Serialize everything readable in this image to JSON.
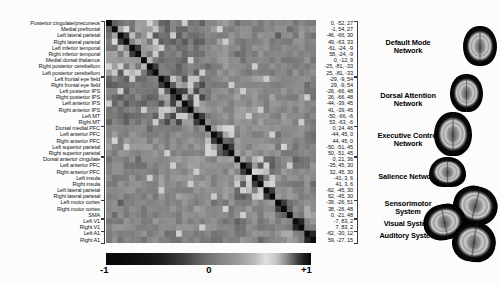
{
  "figure_type": "resting-state functional connectivity correlation matrix",
  "chart_data": {
    "type": "heatmap",
    "size": 36,
    "regions": [
      {
        "label": "Posterior cingulate/precuneus",
        "coord": "0, -52, 27"
      },
      {
        "label": "Medial prefrontal",
        "coord": "-1, 54, 27"
      },
      {
        "label": "Left lateral parietal",
        "coord": "-46, -66, 30"
      },
      {
        "label": "Right lateral parietal",
        "coord": "49, -63, 33"
      },
      {
        "label": "Left inferior temporal",
        "coord": "-61, -24, -9"
      },
      {
        "label": "Right inferior temporal",
        "coord": "58, -24, -9"
      },
      {
        "label": "Medial dorsal thalamus",
        "coord": "0, -12, 9"
      },
      {
        "label": "Right posterior cerebellum",
        "coord": "-25, -81, -33"
      },
      {
        "label": "Left posterior cerebellum",
        "coord": "25, -81, -33"
      },
      {
        "label": "Left frontal eye field",
        "coord": "-29, -9, 54"
      },
      {
        "label": "Right frontal eye field",
        "coord": "29, -9, 54"
      },
      {
        "label": "Left posterior IPS",
        "coord": "-26, -66, 48"
      },
      {
        "label": "Right posterior IPS",
        "coord": "26, -66, 48"
      },
      {
        "label": "Left anterior IPS",
        "coord": "-44, -39, 45"
      },
      {
        "label": "Right anterior IPS",
        "coord": "41, -39, 45"
      },
      {
        "label": "Left MT",
        "coord": "-50, -66, -6"
      },
      {
        "label": "Right MT",
        "coord": "53, -63, -6"
      },
      {
        "label": "Dorsal medial PFC",
        "coord": "0, 24, 46"
      },
      {
        "label": "Left anterior PFC",
        "coord": "-44, 45, 0"
      },
      {
        "label": "Right anterior PFC",
        "coord": "44, 45, 0"
      },
      {
        "label": "Left superior parietal",
        "coord": "-50, -51, 45"
      },
      {
        "label": "Right superior parietal",
        "coord": "50, -51, 45"
      },
      {
        "label": "Dorsal anterior cingulate",
        "coord": "0, 21, 36"
      },
      {
        "label": "Left anterior PFC",
        "coord": "-35, 45, 30"
      },
      {
        "label": "Right anterior PFC",
        "coord": "32, 45, 30"
      },
      {
        "label": "Left insula",
        "coord": "-41, 3, 6"
      },
      {
        "label": "Right insula",
        "coord": "41, 3, 6"
      },
      {
        "label": "Left lateral parietal",
        "coord": "-62, -45, 30"
      },
      {
        "label": "Right lateral parietal",
        "coord": "62, -45, 30"
      },
      {
        "label": "Left motor cortex",
        "coord": "-39, -26, 51"
      },
      {
        "label": "Right motor cortex",
        "coord": "38, -26, 48"
      },
      {
        "label": "SMA",
        "coord": "0, -21, 48"
      },
      {
        "label": "Left V1",
        "coord": "-7, 83, 2"
      },
      {
        "label": "Right V1",
        "coord": "7, 83, 2"
      },
      {
        "label": "Left A1",
        "coord": "-62, -30, 12"
      },
      {
        "label": "Right A1",
        "coord": "59, -27, 15"
      }
    ],
    "networks": [
      {
        "name": "Default Mode Network",
        "lines": [
          "Default Mode",
          "Network"
        ],
        "start": 0,
        "count": 9
      },
      {
        "name": "Dorsal Attention Network",
        "lines": [
          "Dorsal Attention",
          "Network"
        ],
        "start": 9,
        "count": 8
      },
      {
        "name": "Executive Control Network",
        "lines": [
          "Executive Control",
          "Network"
        ],
        "start": 17,
        "count": 5
      },
      {
        "name": "Salience Network",
        "lines": [
          "Salience Network"
        ],
        "start": 22,
        "count": 7
      },
      {
        "name": "Sensorimotor System",
        "lines": [
          "Sensorimotor",
          "System"
        ],
        "start": 29,
        "count": 3
      },
      {
        "name": "Visual System",
        "lines": [
          "Visual System"
        ],
        "start": 32,
        "count": 2
      },
      {
        "name": "Auditory System",
        "lines": [
          "Auditory System"
        ],
        "start": 34,
        "count": 2
      }
    ],
    "network_block_r": [
      [
        0.72,
        0.02,
        0.18,
        0.12,
        0.08,
        0.15,
        0.12
      ],
      [
        0.02,
        0.75,
        0.15,
        0.2,
        0.18,
        0.15,
        0.1
      ],
      [
        0.18,
        0.15,
        0.7,
        0.2,
        0.12,
        0.12,
        0.1
      ],
      [
        0.12,
        0.2,
        0.2,
        0.72,
        0.18,
        0.1,
        0.15
      ],
      [
        0.08,
        0.18,
        0.12,
        0.18,
        0.78,
        0.15,
        0.25
      ],
      [
        0.15,
        0.15,
        0.12,
        0.1,
        0.15,
        0.85,
        0.18
      ],
      [
        0.12,
        0.1,
        0.1,
        0.15,
        0.25,
        0.18,
        0.85
      ]
    ],
    "diagonal_r": 1,
    "homotopic_r": 0.88,
    "homotopic_pairs": [
      [
        2,
        3
      ],
      [
        4,
        5
      ],
      [
        7,
        8
      ],
      [
        9,
        10
      ],
      [
        11,
        12
      ],
      [
        13,
        14
      ],
      [
        15,
        16
      ],
      [
        18,
        19
      ],
      [
        20,
        21
      ],
      [
        23,
        24
      ],
      [
        25,
        26
      ],
      [
        27,
        28
      ],
      [
        29,
        30
      ],
      [
        32,
        33
      ],
      [
        34,
        35
      ]
    ],
    "cell_overrides": [
      [
        32,
        33,
        0.92
      ],
      [
        34,
        35,
        0.92
      ],
      [
        29,
        31,
        0.8
      ],
      [
        30,
        31,
        0.82
      ],
      [
        0,
        1,
        0.82
      ],
      [
        0,
        2,
        0.8
      ],
      [
        0,
        3,
        0.78
      ],
      [
        1,
        2,
        0.72
      ],
      [
        2,
        4,
        0.68
      ],
      [
        6,
        0,
        0.3
      ],
      [
        6,
        1,
        0.28
      ],
      [
        6,
        2,
        0.25
      ],
      [
        6,
        3,
        0.3
      ],
      [
        6,
        4,
        0.28
      ],
      [
        6,
        5,
        0.25
      ],
      [
        7,
        1,
        0.3
      ],
      [
        8,
        0,
        0.32
      ],
      [
        11,
        2,
        0.5
      ],
      [
        13,
        0,
        0.5
      ],
      [
        9,
        4,
        0.5
      ],
      [
        14,
        6,
        0.5
      ],
      [
        19,
        1,
        0.52
      ],
      [
        20,
        3,
        0.5
      ],
      [
        23,
        11,
        0.5
      ],
      [
        26,
        14,
        0.5
      ],
      [
        30,
        20,
        0.52
      ],
      [
        27,
        9,
        0.5
      ],
      [
        33,
        16,
        0.5
      ],
      [
        28,
        18,
        0.5
      ],
      [
        21,
        10,
        0.5
      ],
      [
        31,
        23,
        0.5
      ],
      [
        25,
        7,
        0.5
      ],
      [
        34,
        12,
        0.5
      ],
      [
        16,
        8,
        0.5
      ],
      [
        24,
        15,
        0.5
      ],
      [
        17,
        20,
        0.52
      ],
      [
        18,
        21,
        0.5
      ],
      [
        10,
        0,
        -0.1
      ],
      [
        12,
        1,
        -0.05
      ],
      [
        15,
        3,
        -0.1
      ],
      [
        22,
        5,
        -0.05
      ],
      [
        29,
        2,
        -0.1
      ],
      [
        35,
        26,
        -0.05
      ],
      [
        17,
        7,
        -0.05
      ],
      [
        32,
        22,
        -0.08
      ],
      [
        13,
        3,
        -0.12
      ],
      [
        16,
        0,
        -0.08
      ]
    ],
    "noise_seed": 20211,
    "noise_amp": 0.13,
    "colorbar": {
      "min": -1,
      "max": 1,
      "ticks": [
        "-1",
        "0",
        "+1"
      ]
    },
    "colormap_gray_stops": [
      [
        0,
        0.03
      ],
      [
        0.08,
        0.04
      ],
      [
        0.18,
        0.07
      ],
      [
        0.28,
        0.12
      ],
      [
        0.38,
        0.25
      ],
      [
        0.48,
        0.42
      ],
      [
        0.56,
        0.52
      ],
      [
        0.64,
        0.6
      ],
      [
        0.72,
        0.72
      ],
      [
        0.78,
        0.88
      ],
      [
        0.83,
        0.78
      ],
      [
        0.88,
        0.55
      ],
      [
        0.93,
        0.28
      ],
      [
        0.97,
        0.1
      ],
      [
        1,
        0.04
      ]
    ],
    "brains": [
      {
        "network": "Default Mode Network",
        "view": "axial"
      },
      {
        "network": "Dorsal Attention Network",
        "view": "axial"
      },
      {
        "network": "Executive Control Network",
        "view": "axial"
      },
      {
        "network": "Salience Network",
        "view": "coronal"
      },
      {
        "network": "Sensorimotor System",
        "view": "axial"
      },
      {
        "network": "Visual System",
        "view": "axial"
      },
      {
        "network": "Auditory System",
        "view": "axial"
      }
    ]
  }
}
